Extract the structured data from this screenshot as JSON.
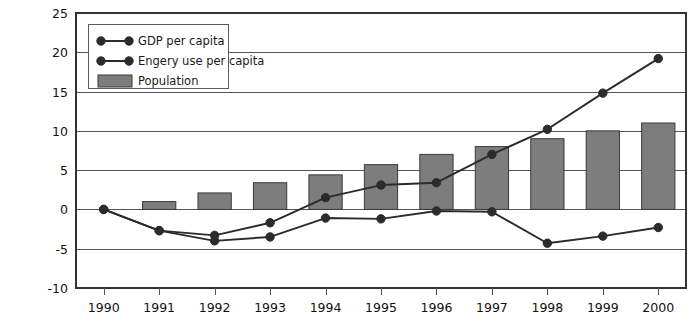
{
  "chart_data": {
    "type": "bar",
    "title": "",
    "subtitle": "",
    "xlabel": "",
    "ylabel": "",
    "categories": [
      "1990",
      "1991",
      "1992",
      "1993",
      "1994",
      "1995",
      "1996",
      "1997",
      "1998",
      "1999",
      "2000"
    ],
    "ylim": [
      -10,
      25
    ],
    "ytick_step": 5,
    "yticks": [
      "25",
      "20",
      "15",
      "10",
      "5",
      "0",
      "-5",
      "-10"
    ],
    "ytick_values": [
      25,
      20,
      15,
      10,
      5,
      0,
      -5,
      -10
    ],
    "grid": true,
    "grid_axis": "y",
    "legend_position": "top-left-inside",
    "series": [
      {
        "name": "GDP per capita",
        "type": "line",
        "marker": "circle",
        "color": "#2b2b2b",
        "values": [
          0.0,
          -2.7,
          -3.3,
          -1.7,
          1.5,
          3.1,
          3.4,
          7.0,
          10.2,
          14.8,
          19.2
        ]
      },
      {
        "name": "Engery use per capita",
        "type": "line",
        "marker": "circle",
        "color": "#2b2b2b",
        "values": [
          0.0,
          -2.7,
          -4.0,
          -3.5,
          -1.1,
          -1.2,
          -0.2,
          -0.3,
          -4.3,
          -3.4,
          -2.3
        ]
      },
      {
        "name": "Population",
        "type": "bar",
        "color": "#7d7d7d",
        "values": [
          0.0,
          1.0,
          2.1,
          3.4,
          4.4,
          5.7,
          7.0,
          8.0,
          9.0,
          10.0,
          11.0
        ]
      }
    ]
  },
  "legend": {
    "items": [
      {
        "label": "GDP per capita",
        "marker": "line-with-dots"
      },
      {
        "label": "Engery use per capita",
        "marker": "line-with-dots"
      },
      {
        "label": "Population",
        "marker": "filled-rectangle"
      }
    ]
  },
  "colors": {
    "bar_fill": "#7d7d7d",
    "bar_stroke": "#3a3a3a",
    "line": "#2b2b2b",
    "gridline": "#555555",
    "frame": "#333333",
    "background": "#ffffff",
    "text": "#111111"
  }
}
